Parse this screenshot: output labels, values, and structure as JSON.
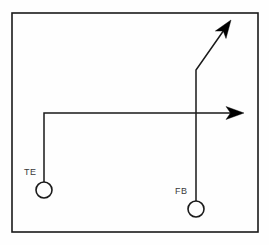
{
  "diagram": {
    "type": "american-football-route-tree",
    "background_color": "#fefefe",
    "stroke_color": "#1a1a1a",
    "label_color": "#3a3a3a",
    "field_border": {
      "name": "field-boundary",
      "x": 12,
      "y": 13,
      "width": 246,
      "height": 219,
      "stroke_width": 1.6
    },
    "players": [
      {
        "id": "TE",
        "label": "TE",
        "position_name": "tight-end",
        "marker_shape": "circle",
        "cx": 44,
        "cy": 190,
        "r": 8,
        "label_x": 24,
        "label_y": 175
      },
      {
        "id": "FB",
        "label": "FB",
        "position_name": "fullback",
        "marker_shape": "circle",
        "cx": 196,
        "cy": 209,
        "r": 8,
        "label_x": 175,
        "label_y": 194
      }
    ],
    "routes": [
      {
        "id": "te-route",
        "player": "TE",
        "description": "vertical stem then break right, horizontal out",
        "points": "44,182 44,113 238,113",
        "arrowhead": "horizontal-right",
        "arrow_tip_x": 244,
        "arrow_tip_y": 113
      },
      {
        "id": "fb-route",
        "player": "FB",
        "description": "vertical stem then angled corner route up-right",
        "points": "196,201 196,70 226,27",
        "arrowhead": "diagonal-up-right",
        "arrow_tip_x": 231,
        "arrow_tip_y": 20
      }
    ],
    "arrowheads": [
      {
        "id": "arrowhead-horizontal",
        "name": "route-arrowhead-te",
        "angle_deg": 0,
        "tip_x": 244,
        "tip_y": 113
      },
      {
        "id": "arrowhead-diagonal",
        "name": "route-arrowhead-fb",
        "angle_deg": -55,
        "tip_x": 231,
        "tip_y": 20
      }
    ]
  }
}
